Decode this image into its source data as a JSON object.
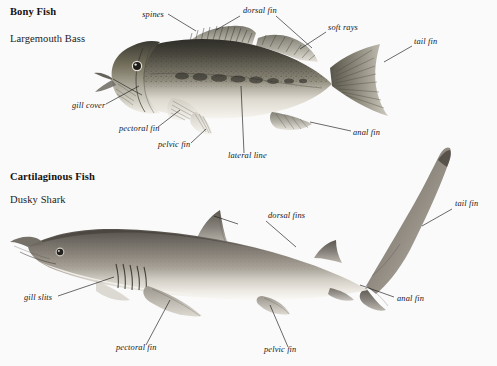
{
  "page": {
    "background_color": "#fafafa",
    "width": 497,
    "height": 366
  },
  "sections": [
    {
      "id": "bony",
      "heading": "Bony Fish",
      "subject": "Largemouth Bass"
    },
    {
      "id": "cartilaginous",
      "heading": "Cartilaginous Fish",
      "subject": "Dusky Shark"
    }
  ],
  "bony_fish_labels": [
    {
      "text": "spines",
      "x": 164,
      "y": 16,
      "anchor": "end"
    },
    {
      "text": "dorsal fin",
      "x": 243,
      "y": 12,
      "anchor": "start"
    },
    {
      "text": "soft rays",
      "x": 328,
      "y": 29,
      "anchor": "start"
    },
    {
      "text": "tail fin",
      "x": 414,
      "y": 43,
      "anchor": "start"
    },
    {
      "text": "gill cover",
      "x": 72,
      "y": 107,
      "anchor": "start"
    },
    {
      "text": "pectoral fin",
      "x": 119,
      "y": 130,
      "anchor": "start"
    },
    {
      "text": "pelvic fin",
      "x": 158,
      "y": 146,
      "anchor": "start"
    },
    {
      "text": "lateral line",
      "x": 228,
      "y": 157,
      "anchor": "start"
    },
    {
      "text": "anal fin",
      "x": 353,
      "y": 134,
      "anchor": "start"
    }
  ],
  "shark_labels": [
    {
      "text": "dorsal fins",
      "x": 268,
      "y": 217,
      "anchor": "start"
    },
    {
      "text": "tail fin",
      "x": 455,
      "y": 205,
      "anchor": "start"
    },
    {
      "text": "anal fin",
      "x": 397,
      "y": 300,
      "anchor": "start"
    },
    {
      "text": "gill slits",
      "x": 24,
      "y": 299,
      "anchor": "start"
    },
    {
      "text": "pectoral fin",
      "x": 116,
      "y": 349,
      "anchor": "start"
    },
    {
      "text": "pelvic fin",
      "x": 264,
      "y": 351,
      "anchor": "start"
    }
  ],
  "colors": {
    "ink": "#1b1b1b",
    "label_text": "#15151a",
    "heading_text": "#121212",
    "bass_dorsal": "#3b3a33",
    "bass_mid": "#8d8a7c",
    "bass_belly": "#f2f0e9",
    "shark_dorsal": "#5f5a50",
    "shark_mid": "#9b958a",
    "shark_belly": "#f4f2ec",
    "fin_tone": "#b5b1a6"
  }
}
